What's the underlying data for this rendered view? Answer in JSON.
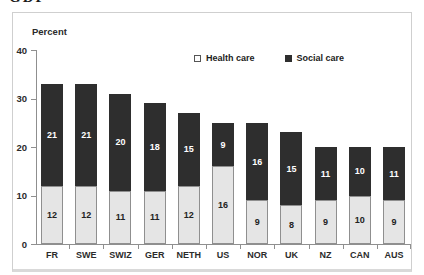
{
  "page": {
    "clipped_title": "GDP"
  },
  "chart": {
    "y_axis_title": "Percent",
    "y_ticks": [
      40,
      30,
      20,
      10,
      0
    ],
    "legend": [
      {
        "label": "Health care",
        "swatch": "light"
      },
      {
        "label": "Social care",
        "swatch": "dark"
      }
    ],
    "colors": {
      "health_fill": "#e5e5e5",
      "health_border": "#8f8f8f",
      "social_fill": "#2e2e2e",
      "label_on_social": "#ffffff",
      "label_on_health": "#222222",
      "axis": "#8f8f8f",
      "frame_border": "#cfcfcf"
    }
  },
  "chart_data": {
    "type": "bar",
    "stacked": true,
    "title": "",
    "xlabel": "",
    "ylabel": "Percent",
    "ylim": [
      0,
      40
    ],
    "grid": false,
    "legend_position": "top-center-inside",
    "categories": [
      "FR",
      "SWE",
      "SWIZ",
      "GER",
      "NETH",
      "US",
      "NOR",
      "UK",
      "NZ",
      "CAN",
      "AUS"
    ],
    "series": [
      {
        "name": "Health care",
        "values": [
          12,
          12,
          11,
          11,
          12,
          16,
          9,
          8,
          9,
          10,
          9
        ]
      },
      {
        "name": "Social care",
        "values": [
          21,
          21,
          20,
          18,
          15,
          9,
          16,
          15,
          11,
          10,
          11
        ]
      }
    ]
  }
}
